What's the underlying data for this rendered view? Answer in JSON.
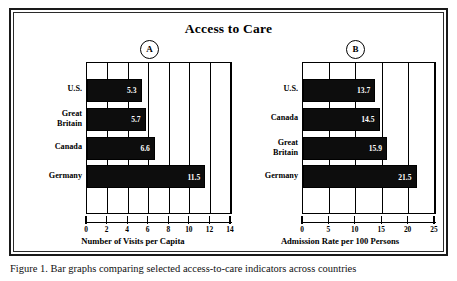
{
  "figure": {
    "title": "Access to Care",
    "caption": "Figure 1. Bar graphs comparing selected access-to-care indicators across countries"
  },
  "chart_data": [
    {
      "type": "bar",
      "panel_label": "A",
      "orientation": "horizontal",
      "title": "Access to Care",
      "categories": [
        "U.S.",
        "Great\nBritain",
        "Canada",
        "Germany"
      ],
      "values": [
        5.3,
        5.7,
        6.6,
        11.5
      ],
      "value_labels": [
        "5.3",
        "5.7",
        "6.6",
        "11.5"
      ],
      "xlabel": "Number of Visits per Capita",
      "ylabel": "",
      "xlim": [
        0,
        14
      ],
      "xticks": [
        0,
        2,
        4,
        6,
        8,
        10,
        12,
        14
      ],
      "xtick_labels": [
        "0",
        "2",
        "4",
        "6",
        "8",
        "10",
        "12",
        "14"
      ],
      "grid": true,
      "legend": "none",
      "bar_color": "#0d0d0d"
    },
    {
      "type": "bar",
      "panel_label": "B",
      "orientation": "horizontal",
      "title": "Access to Care",
      "categories": [
        "U.S.",
        "Canada",
        "Great\nBritain",
        "Germany"
      ],
      "values": [
        13.7,
        14.5,
        15.9,
        21.5
      ],
      "value_labels": [
        "13.7",
        "14.5",
        "15.9",
        "21.5"
      ],
      "xlabel": "Admission Rate per 100 Persons",
      "ylabel": "",
      "xlim": [
        0,
        25
      ],
      "xticks": [
        0,
        5,
        10,
        15,
        20,
        25
      ],
      "xtick_labels": [
        "0",
        "5",
        "10",
        "15",
        "20",
        "25"
      ],
      "grid": true,
      "legend": "none",
      "bar_color": "#0d0d0d"
    }
  ]
}
